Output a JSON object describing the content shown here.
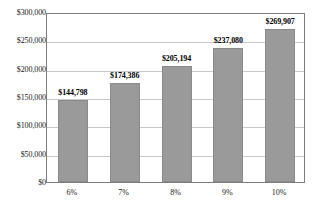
{
  "chart_data": {
    "type": "bar",
    "title": "",
    "subtitle": "",
    "xlabel": "",
    "ylabel": "",
    "categories": [
      "6%",
      "7%",
      "8%",
      "9%",
      "10%"
    ],
    "values": [
      144798,
      174386,
      205194,
      237080,
      269907
    ],
    "value_labels": [
      "$144,798",
      "$174,386",
      "$205,194",
      "$237,080",
      "$269,907"
    ],
    "ylim": [
      0,
      300000
    ],
    "ytick_values": [
      0,
      50000,
      100000,
      150000,
      200000,
      250000,
      300000
    ],
    "ytick_labels": [
      "$0",
      "$50,000",
      "$100,000",
      "$150,000",
      "$200,000",
      "$250,000",
      "$300,000"
    ],
    "grid": "horizontal",
    "legend": "none",
    "series": [
      {
        "name": "",
        "values": [
          144798,
          174386,
          205194,
          237080,
          269907
        ]
      }
    ],
    "colors": {
      "bar_fill": "#9a9a9a",
      "bar_border": "#8a8a8a",
      "gridline": "#c8c8c8",
      "axis_frame": "#7d7d7d",
      "text": "#1a1a1a",
      "label_text": "#000000",
      "background": "#ffffff"
    }
  }
}
